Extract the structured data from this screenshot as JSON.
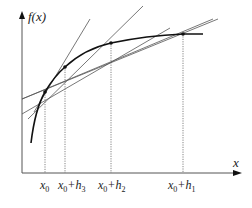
{
  "diagram": {
    "y_axis_label": "f(x)",
    "x_axis_label": "x",
    "points": [
      {
        "name": "x0",
        "label_main": "x",
        "label_sub": "0",
        "label_rest": "",
        "label_rest_sub": ""
      },
      {
        "name": "x0+h3",
        "label_main": "x",
        "label_sub": "0",
        "label_rest": "+h",
        "label_rest_sub": "3"
      },
      {
        "name": "x0+h2",
        "label_main": "x",
        "label_sub": "0",
        "label_rest": "+h",
        "label_rest_sub": "2"
      },
      {
        "name": "x0+h1",
        "label_main": "x",
        "label_sub": "0",
        "label_rest": "+h",
        "label_rest_sub": "1"
      }
    ]
  }
}
